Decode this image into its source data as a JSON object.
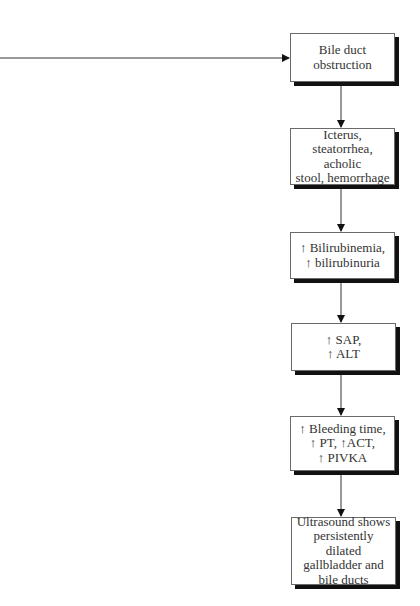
{
  "diagram": {
    "type": "flowchart",
    "incoming_arrow": {
      "from": "left-edge",
      "to": "node-1"
    },
    "nodes": [
      {
        "id": "node-1",
        "label": "Bile duct\nobstruction"
      },
      {
        "id": "node-2",
        "label": "Icterus,\nsteatorrhea, acholic\nstool, hemorrhage"
      },
      {
        "id": "node-3",
        "label": "↑ Bilirubinemia,\n↑ bilirubinuria"
      },
      {
        "id": "node-4",
        "label": "↑ SAP,\n↑ ALT"
      },
      {
        "id": "node-5",
        "label": "↑ Bleeding time,\n↑ PT, ↑ACT,\n↑ PIVKA"
      },
      {
        "id": "node-6",
        "label": "Ultrasound shows\npersistently dilated\ngallbladder and\nbile ducts"
      }
    ],
    "edges": [
      {
        "from": "node-1",
        "to": "node-2"
      },
      {
        "from": "node-2",
        "to": "node-3"
      },
      {
        "from": "node-3",
        "to": "node-4"
      },
      {
        "from": "node-4",
        "to": "node-5"
      },
      {
        "from": "node-5",
        "to": "node-6"
      }
    ],
    "colors": {
      "line": "#333333",
      "shadow": "#111111",
      "border": "#6a6a6a",
      "text": "#333333",
      "background": "#ffffff"
    }
  }
}
